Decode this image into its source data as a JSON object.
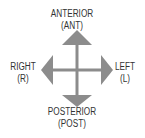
{
  "diagram": {
    "title": "",
    "arrow_color": "#8c8c8c",
    "directions": {
      "up": {
        "label": "ANTERIOR",
        "abbr": "(ANT)"
      },
      "down": {
        "label": "POSTERIOR",
        "abbr": "(POST)"
      },
      "left": {
        "label": "RIGHT",
        "abbr": "(R)"
      },
      "right": {
        "label": "LEFT",
        "abbr": "(L)"
      }
    }
  }
}
